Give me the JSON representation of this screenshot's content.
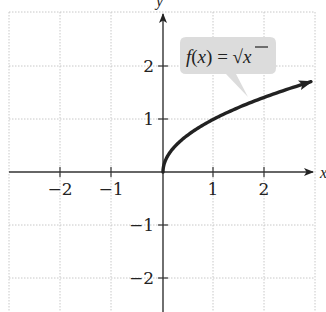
{
  "chart_data": {
    "type": "line",
    "title": "",
    "function_label": "f(x) = √x",
    "function_label_parts": {
      "f": "f",
      "open": "(",
      "var": "x",
      "close": ")",
      "eq": " = ",
      "radical": "√",
      "radicand": "x"
    },
    "xlabel": "x",
    "ylabel": "y",
    "xlim": [
      -3,
      3
    ],
    "ylim": [
      -2.6,
      3
    ],
    "grid": true,
    "x_ticks": [
      -2,
      -1,
      1,
      2
    ],
    "x_tick_labels": [
      "−2",
      "−1",
      "1",
      "2"
    ],
    "y_ticks": [
      -2,
      -1,
      1,
      2
    ],
    "y_tick_labels": [
      "−2",
      "−1",
      "1",
      "2"
    ],
    "series": [
      {
        "name": "f(x) = √x",
        "x": [
          0,
          0.25,
          0.5,
          1,
          1.5,
          2,
          2.5,
          2.9
        ],
        "y": [
          0,
          0.5,
          0.707,
          1,
          1.225,
          1.414,
          1.581,
          1.703
        ],
        "arrow_end": true
      }
    ],
    "colors": {
      "curve": "#222222",
      "axis": "#333333",
      "grid": "#c8c8c8",
      "callout_bg": "#dcdcdc"
    }
  }
}
